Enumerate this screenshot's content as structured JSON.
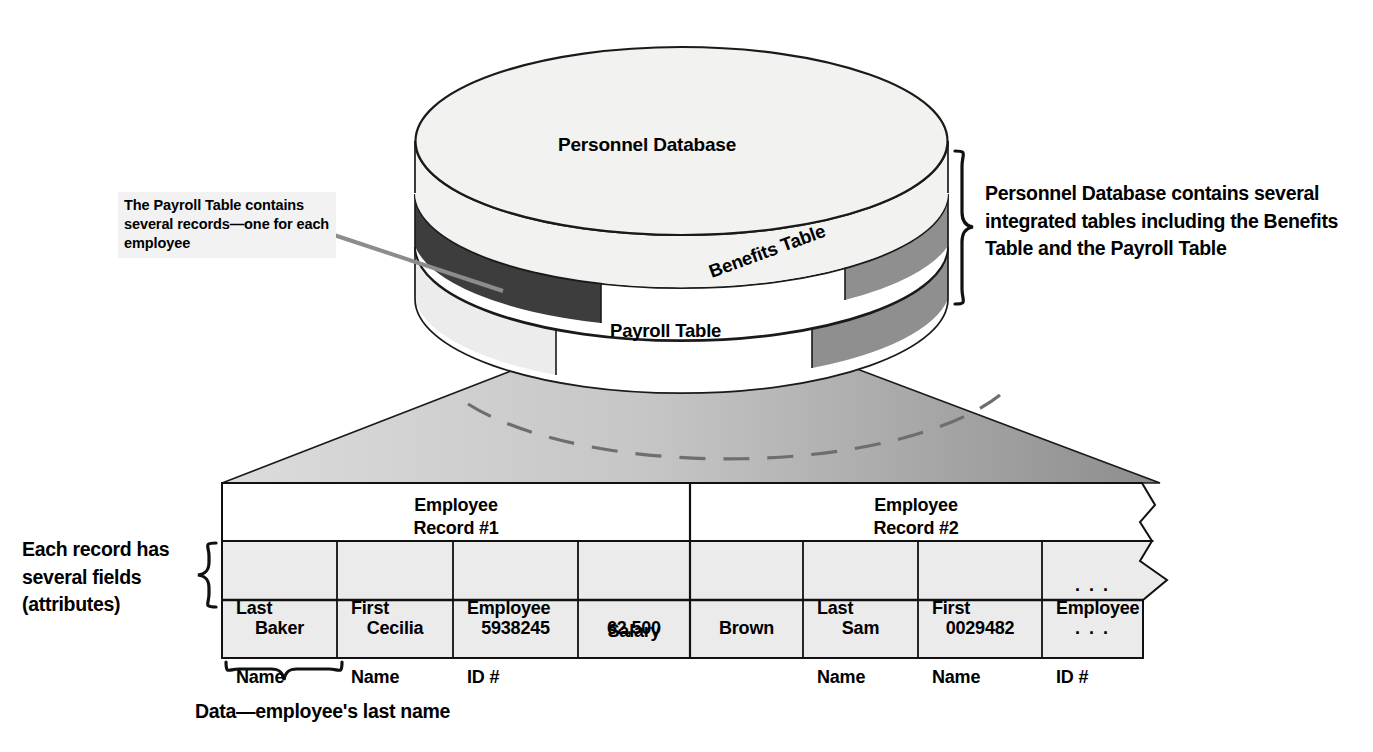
{
  "diagram": {
    "title": "Personnel Database",
    "cylinder": {
      "top_label": "Personnel Database",
      "bands": [
        {
          "name": "benefits",
          "label": "Benefits Table"
        },
        {
          "name": "payroll",
          "label": "Payroll Table"
        }
      ]
    },
    "callouts": {
      "payroll_note": "The Payroll Table contains several records—one for each employee",
      "database_note": "Personnel Database contains several integrated tables including the Benefits Table and the Payroll Table",
      "fields_note": "Each record has several fields (attributes)",
      "data_caption": "Data—employee's last name"
    }
  },
  "table": {
    "records": [
      {
        "label_line1": "Employee",
        "label_line2": "Record #1"
      },
      {
        "label_line1": "Employee",
        "label_line2": "Record #2"
      }
    ],
    "field_headers": [
      {
        "line1": "Last",
        "line2": "Name",
        "align": "left"
      },
      {
        "line1": "First",
        "line2": "Name",
        "align": "left"
      },
      {
        "line1": "Employee",
        "line2": "ID #",
        "align": "left"
      },
      {
        "line1": "Salary",
        "line2": "",
        "align": "center"
      },
      {
        "line1": "Last",
        "line2": "Name",
        "align": "left"
      },
      {
        "line1": "First",
        "line2": "Name",
        "align": "left"
      },
      {
        "line1": "Employee",
        "line2": "ID #",
        "align": "left"
      },
      {
        "line1": "…",
        "line2": "",
        "align": "center"
      }
    ],
    "data_row": [
      "Baker",
      "Cecilia",
      "5938245",
      "62,500",
      "Brown",
      "Sam",
      "0029482",
      ". . ."
    ],
    "ellipsis_header": ". . ."
  },
  "colors": {
    "ink": "#000000",
    "band_dark": "#3c3c3c",
    "band_mid": "#8e8e8e",
    "band_light": "#e2e2e2",
    "cyl_top": "#f2f2f0",
    "funnel_light": "#d8d8d8",
    "funnel_dark": "#8a8a8a",
    "cell_fill": "#ebebeb",
    "leader": "#8c8c8c",
    "callout_bg": "#f2f2f2"
  }
}
